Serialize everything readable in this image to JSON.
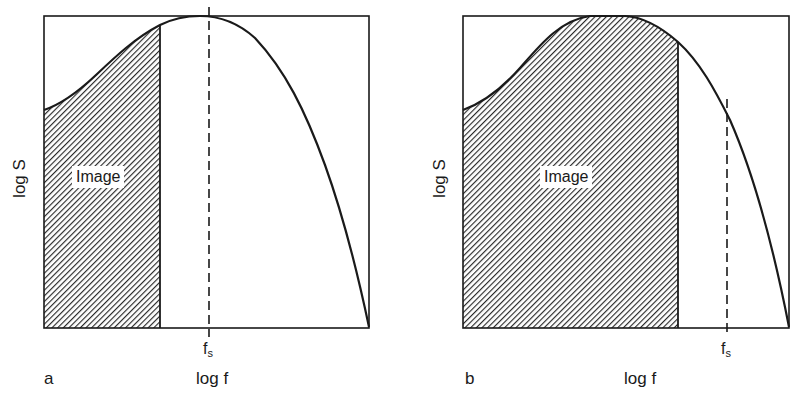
{
  "figure": {
    "panels": [
      {
        "id": "a",
        "panel_label": "a",
        "y_axis_label": "log S",
        "x_axis_label": "log f",
        "region_label": "Image",
        "cutoff_label_main": "f",
        "cutoff_label_sub": "s",
        "description": "Image content band is narrower than half the sampling frequency; f_s marked at spectrum peak"
      },
      {
        "id": "b",
        "panel_label": "b",
        "y_axis_label": "log S",
        "x_axis_label": "log f",
        "region_label": "Image",
        "cutoff_label_main": "f",
        "cutoff_label_sub": "s",
        "description": "Image content band extends past spectrum peak; f_s marked on falling side"
      }
    ],
    "colors": {
      "line": "#1a1a1a",
      "hatch": "#2a2a2a",
      "background": "#ffffff"
    }
  }
}
